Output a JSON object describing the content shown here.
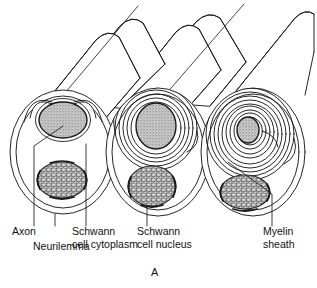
{
  "figure": {
    "panel_label": "A",
    "background_color": "#ffffff",
    "line_color": "#1a1a1a",
    "axon_fill": "#b0b0b0",
    "nucleus_fill": "#909090"
  },
  "labels": [
    {
      "id": "axon",
      "text": "Axon",
      "line2": "",
      "x": 12,
      "y": 231
    },
    {
      "id": "neurilemma",
      "text": "Neurilemma",
      "line2": "",
      "x": 33,
      "y": 246
    },
    {
      "id": "schwann-cytoplasm",
      "text": "Schwann",
      "line2": "cell cytoplasm",
      "x": 72,
      "y": 231
    },
    {
      "id": "schwann-nucleus",
      "text": "Schwann",
      "line2": "cell nucleus",
      "x": 137,
      "y": 231
    },
    {
      "id": "myelin-sheath",
      "text": "Myelin",
      "line2": "sheath",
      "x": 263,
      "y": 231
    }
  ],
  "structures": [
    {
      "id": "fiber-left",
      "name": "unmyelinated fiber",
      "myelin_turns": 0
    },
    {
      "id": "fiber-middle",
      "name": "lightly myelinated fiber",
      "myelin_turns": 5
    },
    {
      "id": "fiber-right",
      "name": "heavily myelinated fiber",
      "myelin_turns": 9
    }
  ]
}
